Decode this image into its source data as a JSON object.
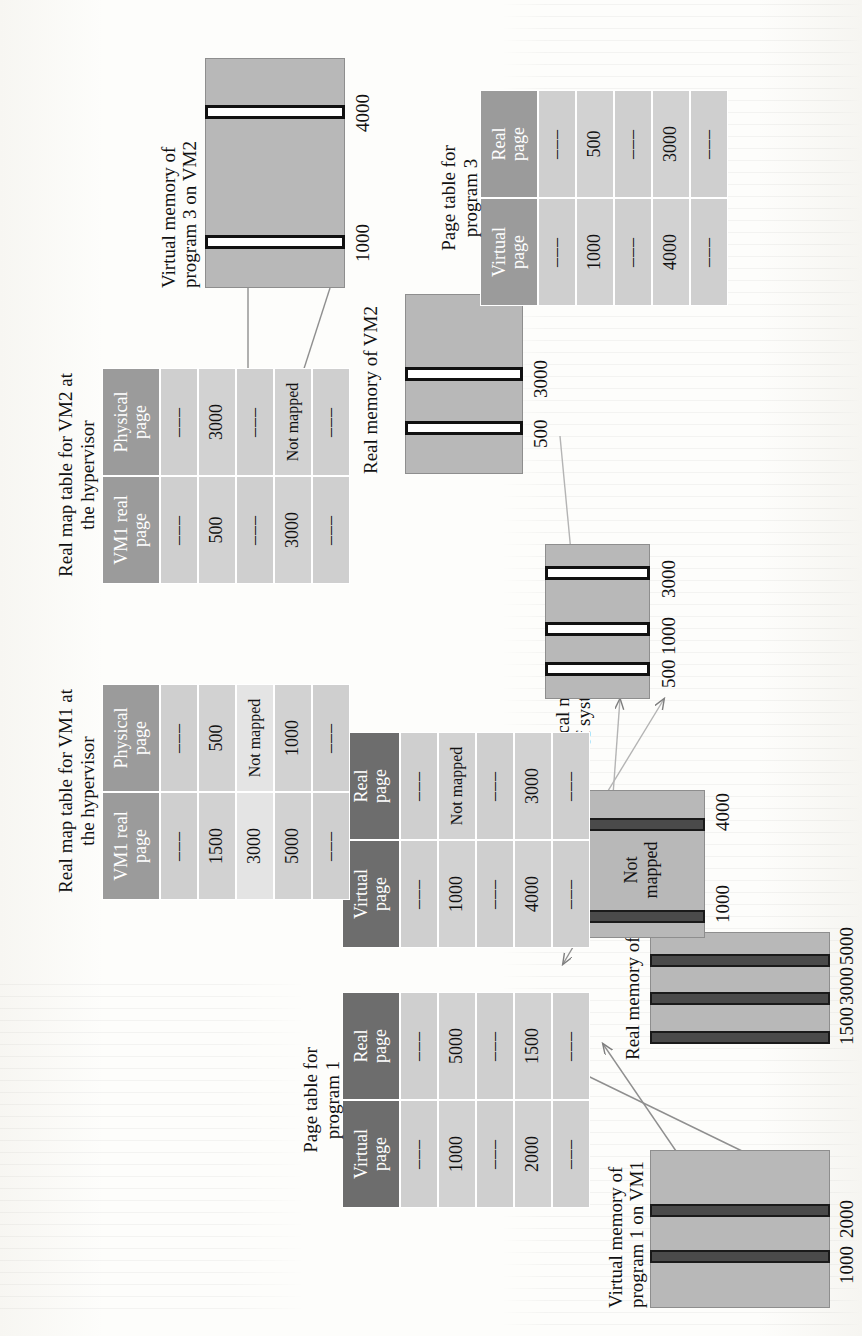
{
  "figure": {
    "type": "diagram"
  },
  "blocks": [
    {
      "id": "vm1_prog1",
      "label": "Virtual memory of\nprogram 1 on VM1",
      "slots": [
        "1000",
        "2000"
      ]
    },
    {
      "id": "vm1_real",
      "label": "Real memory of VM1",
      "slots": [
        "1500",
        "3000",
        "5000"
      ]
    },
    {
      "id": "vm1_prog2",
      "label": "Virtual memory of\nprogram 2 on VM1",
      "slots": [
        "1000",
        "4000"
      ],
      "inner_note": "Not\nmapped"
    },
    {
      "id": "physical",
      "label": "Physical memory\nof system",
      "slots": [
        "500",
        "1000",
        "3000"
      ]
    },
    {
      "id": "vm2_real",
      "label": "Real memory of VM2",
      "slots": [
        "500",
        "3000"
      ]
    },
    {
      "id": "vm2_prog3",
      "label": "Virtual memory of\nprogram 3 on VM2",
      "slots": [
        "1000",
        "4000"
      ]
    }
  ],
  "tables": [
    {
      "id": "pt_program1",
      "caption": "Page table for\nprogram 1",
      "headers": [
        "Virtual\npage",
        "Real\npage"
      ],
      "rows": [
        [
          "–––",
          "–––"
        ],
        [
          "1000",
          "5000"
        ],
        [
          "–––",
          "–––"
        ],
        [
          "2000",
          "1500"
        ],
        [
          "–––",
          "–––"
        ]
      ]
    },
    {
      "id": "pt_program2",
      "caption": "Page table for\nprogram 2",
      "headers": [
        "Virtual\npage",
        "Real\npage"
      ],
      "rows": [
        [
          "–––",
          "–––"
        ],
        [
          "1000",
          "Not mapped"
        ],
        [
          "–––",
          "–––"
        ],
        [
          "4000",
          "3000"
        ],
        [
          "–––",
          "–––"
        ]
      ]
    },
    {
      "id": "pt_program3",
      "caption": "Page table for\nprogram 3",
      "headers": [
        "Virtual\npage",
        "Real\npage"
      ],
      "rows": [
        [
          "–––",
          "–––"
        ],
        [
          "1000",
          "500"
        ],
        [
          "–––",
          "–––"
        ],
        [
          "4000",
          "3000"
        ],
        [
          "–––",
          "–––"
        ]
      ]
    },
    {
      "id": "rmt_vm1",
      "caption": "Real map table for VM1 at\nthe hypervisor",
      "headers": [
        "VM1 real\npage",
        "Physical\npage"
      ],
      "rows": [
        [
          "–––",
          "–––"
        ],
        [
          "1500",
          "500"
        ],
        [
          "3000",
          "Not mapped"
        ],
        [
          "5000",
          "1000"
        ],
        [
          "–––",
          "–––"
        ]
      ]
    },
    {
      "id": "rmt_vm2",
      "caption": "Real map table for VM2 at\nthe hypervisor",
      "headers": [
        "VM1 real\npage",
        "Physical\npage"
      ],
      "rows": [
        [
          "–––",
          "–––"
        ],
        [
          "500",
          "3000"
        ],
        [
          "–––",
          "–––"
        ],
        [
          "3000",
          "Not mapped"
        ],
        [
          "–––",
          "–––"
        ]
      ]
    }
  ],
  "colors": {
    "block_fill": "#b8b8b8",
    "slot_hollow": "#ffffff",
    "slot_solid": "#4a4a4a",
    "header_dark": "#6d6d6d",
    "header_mid": "#9b9b9b",
    "row_light": "#e4e4e4",
    "row_dark": "#d2d2d2",
    "arrow": "#8a8a8a",
    "text": "#111111",
    "page": "#fdfdfb"
  }
}
